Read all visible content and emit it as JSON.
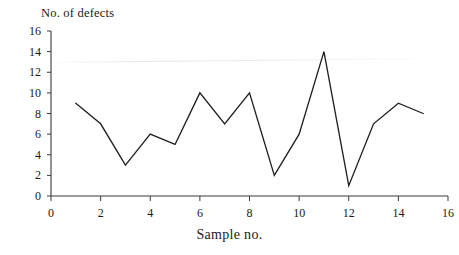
{
  "chart_data": {
    "type": "line",
    "title": "No. of defects",
    "xlabel": "Sample no.",
    "ylabel": "No. of defects",
    "x": [
      1,
      2,
      3,
      4,
      5,
      6,
      7,
      8,
      9,
      10,
      11,
      12,
      13,
      14,
      15
    ],
    "values": [
      9,
      7,
      3,
      6,
      5,
      10,
      7,
      10,
      2,
      6,
      14,
      1,
      7,
      9,
      8
    ],
    "series": [
      {
        "name": "No. of defects",
        "values": [
          9,
          7,
          3,
          6,
          5,
          10,
          7,
          10,
          2,
          6,
          14,
          1,
          7,
          9,
          8
        ]
      }
    ],
    "xlim": [
      0,
      16
    ],
    "ylim": [
      0,
      16
    ],
    "xticks": [
      0,
      2,
      4,
      6,
      8,
      10,
      12,
      14,
      16
    ],
    "ytick_labels": [
      "0",
      "2",
      "4",
      "6",
      "8",
      "10",
      "12",
      "14",
      "16"
    ],
    "xtick_labels": [
      "0",
      "2",
      "4",
      "6",
      "8",
      "10",
      "12",
      "14",
      "16"
    ],
    "yticks": [
      0,
      2,
      4,
      6,
      8,
      10,
      12,
      14,
      16
    ],
    "grid": false,
    "legend": false,
    "line_color": "#231f20",
    "axis_color": "#3a3a3a"
  },
  "axis": {
    "y_title": "No. of defects",
    "x_title": "Sample no."
  }
}
